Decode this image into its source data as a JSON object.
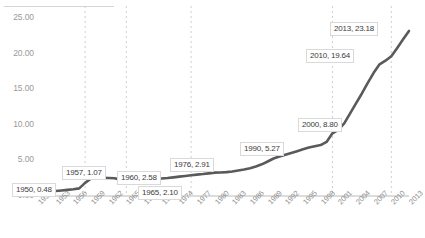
{
  "chart_data": {
    "type": "line",
    "title": "",
    "xlabel": "",
    "ylabel": "",
    "ylim": [
      0,
      25
    ],
    "xlim": [
      1950,
      2013
    ],
    "grid": "vertical-dashed",
    "legend": "none",
    "series_color": "#5a5a5a",
    "x": [
      1950,
      1951,
      1952,
      1953,
      1954,
      1955,
      1956,
      1957,
      1958,
      1959,
      1960,
      1961,
      1962,
      1963,
      1964,
      1965,
      1966,
      1967,
      1968,
      1969,
      1970,
      1971,
      1972,
      1973,
      1974,
      1975,
      1976,
      1977,
      1978,
      1979,
      1980,
      1981,
      1982,
      1983,
      1984,
      1985,
      1986,
      1987,
      1988,
      1989,
      1990,
      1991,
      1992,
      1993,
      1994,
      1995,
      1996,
      1997,
      1998,
      1999,
      2000,
      2001,
      2002,
      2003,
      2004,
      2005,
      2006,
      2007,
      2008,
      2009,
      2010,
      2011,
      2012,
      2013
    ],
    "values": [
      0.48,
      0.55,
      0.62,
      0.7,
      0.78,
      0.86,
      0.95,
      1.07,
      1.85,
      2.45,
      2.58,
      2.55,
      2.52,
      2.5,
      2.3,
      2.1,
      2.12,
      2.18,
      2.22,
      2.3,
      2.38,
      2.45,
      2.52,
      2.62,
      2.72,
      2.82,
      2.91,
      3.0,
      3.08,
      3.18,
      3.28,
      3.3,
      3.35,
      3.45,
      3.58,
      3.72,
      3.9,
      4.15,
      4.45,
      4.85,
      5.27,
      5.55,
      5.8,
      6.05,
      6.3,
      6.55,
      6.8,
      7.0,
      7.15,
      7.6,
      8.8,
      9.3,
      10.2,
      11.6,
      13.0,
      14.4,
      15.9,
      17.3,
      18.5,
      19.0,
      19.64,
      20.8,
      22.0,
      23.18
    ],
    "y_ticks": [
      "0.00",
      "5.00",
      "10.00",
      "15.00",
      "20.00",
      "25.00"
    ],
    "y_tick_values": [
      0,
      5,
      10,
      15,
      20,
      25
    ],
    "x_ticks": [
      "1950",
      "1953",
      "1956",
      "1959",
      "1962",
      "1965",
      "1968",
      "1971",
      "1974",
      "1977",
      "1980",
      "1983",
      "1986",
      "1989",
      "1992",
      "1995",
      "1998",
      "2001",
      "2004",
      "2007",
      "2010",
      "2013"
    ],
    "gridline_years": [
      1958,
      1965,
      1976,
      2000,
      2010
    ],
    "data_labels": [
      {
        "name": "label-1950",
        "text": "1950, 0.48",
        "year": 1950,
        "value": 0.48,
        "x": 12,
        "y": 183
      },
      {
        "name": "label-1957",
        "text": "1957, 1.07",
        "year": 1957,
        "value": 1.07,
        "x": 62,
        "y": 166
      },
      {
        "name": "label-1960",
        "text": "1960, 2.58",
        "year": 1960,
        "value": 2.58,
        "x": 117,
        "y": 171
      },
      {
        "name": "label-1965",
        "text": "1965, 2.10",
        "year": 1965,
        "value": 2.1,
        "x": 138,
        "y": 186
      },
      {
        "name": "label-1976",
        "text": "1976, 2.91",
        "year": 1976,
        "value": 2.91,
        "x": 170,
        "y": 158
      },
      {
        "name": "label-1990",
        "text": "1990, 5.27",
        "year": 1990,
        "value": 5.27,
        "x": 240,
        "y": 142
      },
      {
        "name": "label-2000",
        "text": "2000, 8.80",
        "year": 2000,
        "value": 8.8,
        "x": 298,
        "y": 118
      },
      {
        "name": "label-2010",
        "text": "2010, 19.64",
        "year": 2010,
        "value": 19.64,
        "x": 306,
        "y": 49
      },
      {
        "name": "label-2013",
        "text": "2013, 23.18",
        "year": 2013,
        "value": 23.18,
        "x": 330,
        "y": 22
      }
    ]
  }
}
